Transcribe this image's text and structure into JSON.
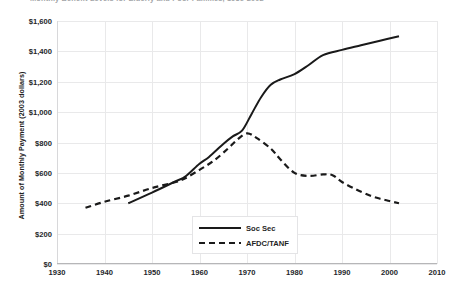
{
  "caption": {
    "text": "Monthly Benefit Levels for Elderly and Poor Families, 1936-2002"
  },
  "chart_data": {
    "type": "line",
    "title": "",
    "xlabel": "",
    "ylabel": "Amount of Monthly Payment (2003 dollars)",
    "xlim": [
      1930,
      2010
    ],
    "ylim": [
      0,
      1600
    ],
    "xticks": [
      "1930",
      "1940",
      "1950",
      "1960",
      "1970",
      "1980",
      "1990",
      "2000",
      "2010"
    ],
    "yticks": [
      "$0",
      "$200",
      "$400",
      "$600",
      "$800",
      "$1,000",
      "$1,200",
      "$1,400",
      "$1,600"
    ],
    "grid": true,
    "legend_position": "bottom-center",
    "series": [
      {
        "name": "Soc Sec",
        "style": "solid",
        "color": "#1a1a1a",
        "x": [
          1945,
          1950,
          1955,
          1957,
          1960,
          1962,
          1965,
          1967,
          1969,
          1971,
          1973,
          1975,
          1977,
          1980,
          1983,
          1986,
          1990,
          1994,
          1998,
          2002
        ],
        "values": [
          400,
          470,
          545,
          575,
          660,
          705,
          790,
          840,
          880,
          990,
          1100,
          1180,
          1215,
          1250,
          1310,
          1375,
          1410,
          1440,
          1470,
          1500
        ]
      },
      {
        "name": "AFDC/TANF",
        "style": "dashed",
        "color": "#1a1a1a",
        "x": [
          1936,
          1940,
          1945,
          1950,
          1955,
          1957,
          1960,
          1963,
          1966,
          1968,
          1970,
          1972,
          1975,
          1977,
          1980,
          1983,
          1986,
          1988,
          1990,
          1993,
          1996,
          1998,
          2000,
          2002
        ],
        "values": [
          370,
          410,
          450,
          500,
          540,
          565,
          620,
          680,
          760,
          820,
          860,
          830,
          760,
          690,
          600,
          580,
          590,
          585,
          540,
          490,
          450,
          430,
          415,
          400
        ]
      }
    ]
  }
}
